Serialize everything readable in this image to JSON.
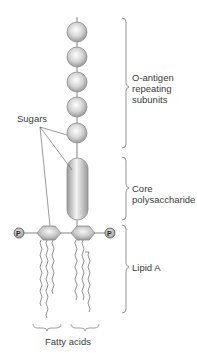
{
  "labels": {
    "sugars": "Sugars",
    "o_antigen_line1": "O-antigen",
    "o_antigen_line2": "repeating",
    "o_antigen_line3": "subunits",
    "core_line1": "Core",
    "core_line2": "polysaccharide",
    "lipid_a": "Lipid A",
    "fatty_acids": "Fatty acids",
    "phosphate": "P"
  },
  "colors": {
    "sugar_fill": "#d9d9d9",
    "sugar_stroke": "#8c8c8c",
    "line": "#555555",
    "text": "#3a3a3a"
  },
  "structure": {
    "o_antigen_subunits": 5,
    "core": "capsule",
    "lipid_a_hexagons": 2,
    "phosphates": 2,
    "fatty_acid_chains": 6
  }
}
